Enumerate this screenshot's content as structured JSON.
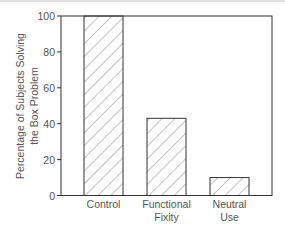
{
  "chart_data": {
    "type": "bar",
    "title": "",
    "xlabel": "",
    "ylabel": "Percentage of Subjects Solving the Box Problem",
    "ylabel_lines": [
      "Percentage of Subjects Solving",
      "the Box Problem"
    ],
    "categories": [
      "Control",
      "Functional Fixity",
      "Neutral Use"
    ],
    "category_lines": [
      [
        "Control"
      ],
      [
        "Functional",
        "Fixity"
      ],
      [
        "Neutral",
        "Use"
      ]
    ],
    "values": [
      100,
      43,
      10
    ],
    "ylim": [
      0,
      100
    ],
    "yticks": [
      0,
      20,
      40,
      60,
      80,
      100
    ],
    "grid": false,
    "legend": null,
    "bar_fill": "diagonal-hatch"
  },
  "colors": {
    "line": "#333333",
    "text": "#555555",
    "hatch": "#666666"
  }
}
